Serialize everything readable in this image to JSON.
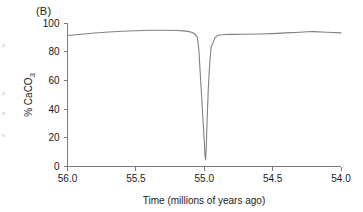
{
  "figure": {
    "panel_label": "(B)",
    "line_color": "#808080",
    "axis_color": "#7a7a7a",
    "background": "#ffffff"
  },
  "chart_data": {
    "type": "line",
    "title": "",
    "panel": "(B)",
    "xlabel": "Time (millions of years ago)",
    "ylabel": "% CaCO3",
    "ylabel_parts": {
      "prefix": "% CaCO",
      "subscript": "3"
    },
    "xlim": [
      56.0,
      54.0
    ],
    "ylim": [
      0,
      100
    ],
    "x_reversed": true,
    "grid": false,
    "legend": null,
    "xticks": [
      56.0,
      55.5,
      55.0,
      54.5,
      54.0
    ],
    "xtick_labels": [
      "56.0",
      "55.5",
      "55.0",
      "54.5",
      "54.0"
    ],
    "yticks": [
      0,
      20,
      40,
      60,
      80,
      100
    ],
    "ytick_labels": [
      "0",
      "20",
      "40",
      "60",
      "80",
      "100"
    ],
    "series": [
      {
        "name": "% CaCO3",
        "color": "#808080",
        "x": [
          56.0,
          55.9,
          55.8,
          55.7,
          55.6,
          55.5,
          55.4,
          55.3,
          55.2,
          55.15,
          55.1,
          55.07,
          55.05,
          55.04,
          55.03,
          55.02,
          55.01,
          55.0,
          54.995,
          54.99,
          54.985,
          54.98,
          54.97,
          54.96,
          54.95,
          54.92,
          54.9,
          54.85,
          54.8,
          54.7,
          54.6,
          54.5,
          54.4,
          54.3,
          54.25,
          54.2,
          54.1,
          54.0
        ],
        "y": [
          91.3,
          92.2,
          93.0,
          93.7,
          94.3,
          94.6,
          94.9,
          95.0,
          94.8,
          94.5,
          93.8,
          92.6,
          90.0,
          82.0,
          66.0,
          50.0,
          34.0,
          18.0,
          8.0,
          4.8,
          14.0,
          30.0,
          55.0,
          72.0,
          83.0,
          90.0,
          91.5,
          92.0,
          92.1,
          92.2,
          92.3,
          92.6,
          93.1,
          93.6,
          93.9,
          94.0,
          93.6,
          93.1
        ]
      }
    ],
    "annotations": []
  }
}
